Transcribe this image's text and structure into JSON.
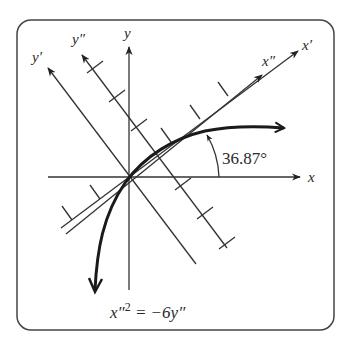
{
  "figure": {
    "frame": {
      "x": 17,
      "y": 20,
      "width": 317,
      "height": 310,
      "radius": 14,
      "stroke": "#444444"
    },
    "colors": {
      "line": "#333333",
      "curve": "#1a1a1a",
      "text": "#2a2a2a"
    },
    "axes": {
      "x": {
        "label": "x"
      },
      "y": {
        "label": "y"
      },
      "x_prime": {
        "label": "x′"
      },
      "y_prime": {
        "label": "y′"
      },
      "x_double_prime": {
        "label": "x″"
      },
      "y_double_prime": {
        "label": "y″"
      }
    },
    "rotation_angle_label": "36.87°",
    "equation": {
      "lhs_base": "x″",
      "lhs_exp": "2",
      "rhs": " = −6y″"
    }
  }
}
